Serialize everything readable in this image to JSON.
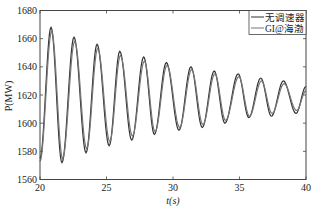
{
  "chart_data": {
    "type": "line",
    "title": "",
    "xlabel": "t(s)",
    "ylabel": "P(MW)",
    "xlim": [
      20,
      40
    ],
    "ylim": [
      1560,
      1680
    ],
    "xticks": [
      20,
      25,
      30,
      35,
      40
    ],
    "yticks": [
      1560,
      1580,
      1600,
      1620,
      1640,
      1660,
      1680
    ],
    "grid": false,
    "legend_position": "upper right",
    "legend": [
      "无调速器",
      "GI@海渤"
    ],
    "series": [
      {
        "name": "无调速器",
        "color": "#333333",
        "peaks": [
          [
            20.83,
            1668
          ],
          [
            22.56,
            1661
          ],
          [
            24.29,
            1656
          ],
          [
            26.0,
            1651
          ],
          [
            27.8,
            1647
          ],
          [
            29.5,
            1643
          ],
          [
            31.35,
            1640
          ],
          [
            33.1,
            1637
          ],
          [
            34.9,
            1635
          ],
          [
            36.6,
            1632
          ],
          [
            38.3,
            1630
          ]
        ],
        "troughs": [
          [
            21.65,
            1572
          ],
          [
            23.46,
            1579
          ],
          [
            25.2,
            1584
          ],
          [
            26.9,
            1588
          ],
          [
            28.6,
            1592
          ],
          [
            30.45,
            1595
          ],
          [
            32.2,
            1597
          ],
          [
            33.9,
            1600
          ],
          [
            35.7,
            1604
          ],
          [
            37.4,
            1605
          ],
          [
            39.25,
            1607
          ]
        ],
        "start": [
          20,
          1575
        ],
        "end": [
          40,
          1626
        ]
      },
      {
        "name": "GI@海渤",
        "color": "#777777",
        "peaks": [
          [
            20.88,
            1665
          ],
          [
            22.61,
            1658
          ],
          [
            24.34,
            1653
          ],
          [
            26.05,
            1648
          ],
          [
            27.85,
            1644
          ],
          [
            29.55,
            1641
          ],
          [
            31.4,
            1638
          ],
          [
            33.15,
            1635
          ],
          [
            34.95,
            1633
          ],
          [
            36.65,
            1630
          ],
          [
            38.35,
            1628
          ]
        ],
        "troughs": [
          [
            21.7,
            1575
          ],
          [
            23.51,
            1582
          ],
          [
            25.25,
            1587
          ],
          [
            26.95,
            1591
          ],
          [
            28.65,
            1594
          ],
          [
            30.5,
            1597
          ],
          [
            32.25,
            1599
          ],
          [
            33.95,
            1602
          ],
          [
            35.75,
            1605
          ],
          [
            37.45,
            1607
          ],
          [
            39.3,
            1609
          ]
        ],
        "start": [
          20,
          1573
        ],
        "end": [
          40,
          1623
        ]
      }
    ]
  }
}
